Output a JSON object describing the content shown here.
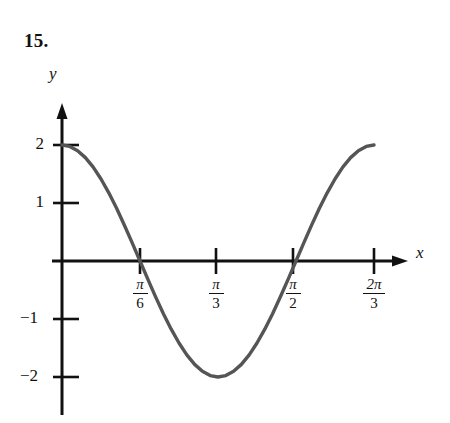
{
  "problem": {
    "number": "15."
  },
  "axes": {
    "x_label": "x",
    "y_label": "y"
  },
  "chart_data": {
    "type": "line",
    "title": "",
    "subtitle": "",
    "xlabel": "x",
    "ylabel": "y",
    "function": "y = 2 cos(3x)",
    "grid": false,
    "legend": null,
    "xlim": [
      0,
      2.0943951
    ],
    "ylim": [
      -2,
      2
    ],
    "x_ticks": [
      {
        "value": 0.5235988,
        "label_num": "π",
        "label_den": "6",
        "label": "π/6"
      },
      {
        "value": 1.0471976,
        "label_num": "π",
        "label_den": "3",
        "label": "π/3"
      },
      {
        "value": 1.5707963,
        "label_num": "π",
        "label_den": "2",
        "label": "π/2"
      },
      {
        "value": 2.0943951,
        "label_num": "2π",
        "label_den": "3",
        "label": "2π/3"
      }
    ],
    "y_ticks": [
      {
        "value": 2,
        "label": "2"
      },
      {
        "value": 1,
        "label": "1"
      },
      {
        "value": -1,
        "label": "−1"
      },
      {
        "value": -2,
        "label": "−2"
      }
    ],
    "series": [
      {
        "name": "y = 2 cos(3x)",
        "color": "#555555",
        "x": [
          0.0,
          0.0523599,
          0.1047198,
          0.1570796,
          0.2094395,
          0.2617994,
          0.3141593,
          0.3665191,
          0.418879,
          0.4712389,
          0.5235988,
          0.5759587,
          0.6283185,
          0.6806784,
          0.7330383,
          0.7853982,
          0.837758,
          0.8901179,
          0.9424778,
          0.9948377,
          1.0471976,
          1.0995574,
          1.1519173,
          1.2042772,
          1.2566371,
          1.3089969,
          1.3613568,
          1.4137167,
          1.4660766,
          1.5184364,
          1.5707963,
          1.6231562,
          1.6755161,
          1.727876,
          1.7802358,
          1.8325957,
          1.8849556,
          1.9373155,
          1.9896753,
          2.0420352,
          2.0943951
        ],
        "y": [
          2.0,
          1.9754,
          1.9021,
          1.782,
          1.618,
          1.4142,
          1.1756,
          0.908,
          0.618,
          0.3129,
          0.0,
          -0.3129,
          -0.618,
          -0.908,
          -1.1756,
          -1.4142,
          -1.618,
          -1.782,
          -1.9021,
          -1.9754,
          -2.0,
          -1.9754,
          -1.9021,
          -1.782,
          -1.618,
          -1.4142,
          -1.1756,
          -0.908,
          -0.618,
          -0.3129,
          0.0,
          0.3129,
          0.618,
          0.908,
          1.1756,
          1.4142,
          1.618,
          1.782,
          1.9021,
          1.9754,
          2.0
        ]
      }
    ],
    "annotations": [],
    "key_points": {
      "maximum_start": {
        "x": 0,
        "y": 2
      },
      "zero_1": {
        "x": 0.5235988,
        "y": 0,
        "label": "π/6"
      },
      "minimum": {
        "x": 1.0471976,
        "y": -2,
        "label": "π/3"
      },
      "zero_2": {
        "x": 1.5707963,
        "y": 0,
        "label": "π/2"
      },
      "maximum_end": {
        "x": 2.0943951,
        "y": 2,
        "label": "2π/3"
      }
    },
    "colors": {
      "curve": "#555555",
      "axis": "#111111",
      "background": "#ffffff"
    }
  }
}
